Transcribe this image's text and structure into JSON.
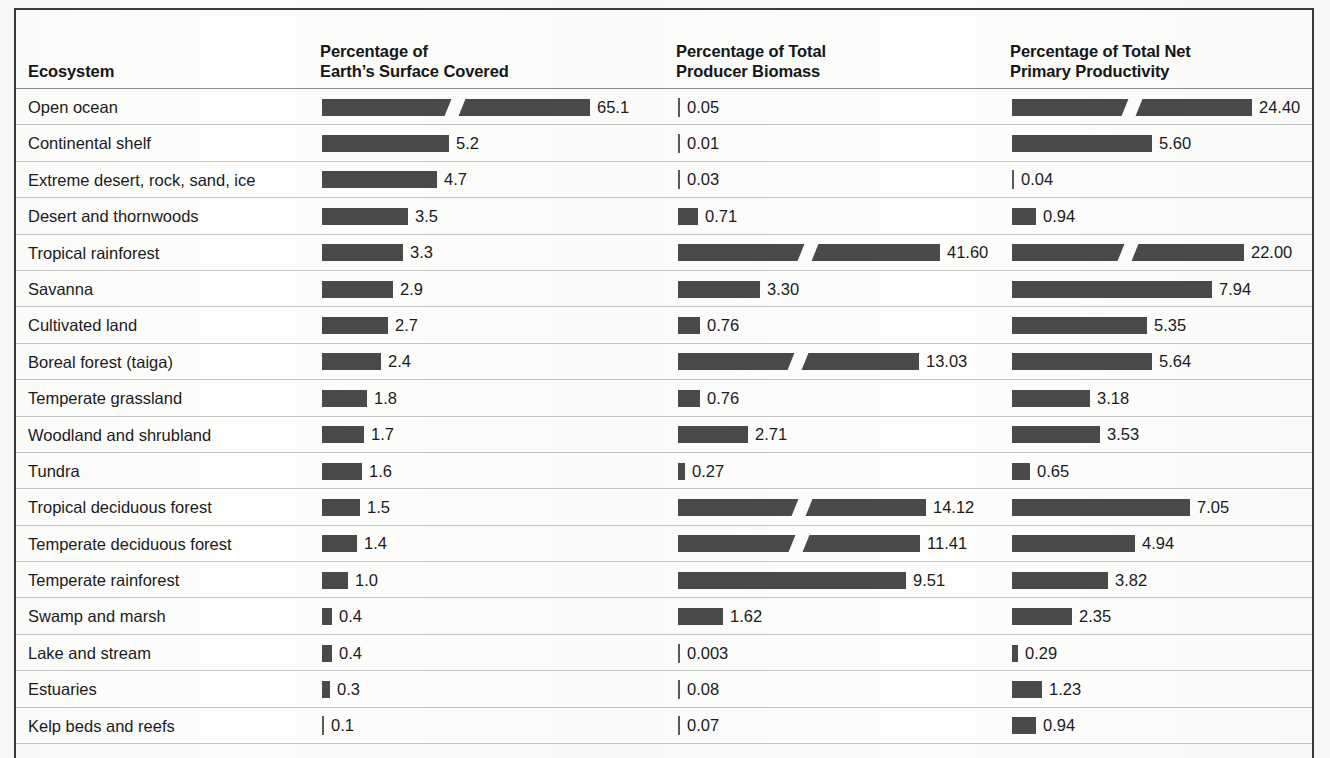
{
  "table": {
    "headers": {
      "ecosystem": {
        "line1": "Ecosystem",
        "line2": ""
      },
      "surface": {
        "line1": "Percentage of",
        "line2": "Earth’s Surface Covered"
      },
      "biomass": {
        "line1": "Percentage of Total",
        "line2": "Producer Biomass"
      },
      "npp": {
        "line1": "Percentage of Total Net",
        "line2": "Primary Productivity"
      }
    },
    "bar_color": "#4a4a4a",
    "rule_color": "#c6c6c6",
    "frame_color": "#3b3b3b",
    "rows": [
      {
        "ecosystem": "Open ocean",
        "surface": "65.1",
        "biomass": "0.05",
        "npp": "24.40"
      },
      {
        "ecosystem": "Continental shelf",
        "surface": "5.2",
        "biomass": "0.01",
        "npp": "5.60"
      },
      {
        "ecosystem": "Extreme desert, rock, sand, ice",
        "surface": "4.7",
        "biomass": "0.03",
        "npp": "0.04"
      },
      {
        "ecosystem": "Desert and thornwoods",
        "surface": "3.5",
        "biomass": "0.71",
        "npp": "0.94"
      },
      {
        "ecosystem": "Tropical rainforest",
        "surface": "3.3",
        "biomass": "41.60",
        "npp": "22.00"
      },
      {
        "ecosystem": "Savanna",
        "surface": "2.9",
        "biomass": "3.30",
        "npp": "7.94"
      },
      {
        "ecosystem": "Cultivated land",
        "surface": "2.7",
        "biomass": "0.76",
        "npp": "5.35"
      },
      {
        "ecosystem": "Boreal forest (taiga)",
        "surface": "2.4",
        "biomass": "13.03",
        "npp": "5.64"
      },
      {
        "ecosystem": "Temperate grassland",
        "surface": "1.8",
        "biomass": "0.76",
        "npp": "3.18"
      },
      {
        "ecosystem": "Woodland and shrubland",
        "surface": "1.7",
        "biomass": "2.71",
        "npp": "3.53"
      },
      {
        "ecosystem": "Tundra",
        "surface": "1.6",
        "biomass": "0.27",
        "npp": "0.65"
      },
      {
        "ecosystem": "Tropical deciduous forest",
        "surface": "1.5",
        "biomass": "14.12",
        "npp": "7.05"
      },
      {
        "ecosystem": "Temperate deciduous forest",
        "surface": "1.4",
        "biomass": "11.41",
        "npp": "4.94"
      },
      {
        "ecosystem": "Temperate rainforest",
        "surface": "1.0",
        "biomass": "9.51",
        "npp": "3.82"
      },
      {
        "ecosystem": "Swamp and marsh",
        "surface": "0.4",
        "biomass": "1.62",
        "npp": "2.35"
      },
      {
        "ecosystem": "Lake and stream",
        "surface": "0.4",
        "biomass": "0.003",
        "npp": "0.29"
      },
      {
        "ecosystem": "Estuaries",
        "surface": "0.3",
        "biomass": "0.08",
        "npp": "1.23"
      },
      {
        "ecosystem": "Kelp beds and reefs",
        "surface": "0.1",
        "biomass": "0.07",
        "npp": "0.94"
      }
    ]
  },
  "chart_data": {
    "type": "bar",
    "orientation": "horizontal",
    "grid": false,
    "legend": null,
    "note": "Bars with a white diagonal slash use a broken (compressed) scale.",
    "categories": [
      "Open ocean",
      "Continental shelf",
      "Extreme desert, rock, sand, ice",
      "Desert and thornwoods",
      "Tropical rainforest",
      "Savanna",
      "Cultivated land",
      "Boreal forest (taiga)",
      "Temperate grassland",
      "Woodland and shrubland",
      "Tundra",
      "Tropical deciduous forest",
      "Temperate deciduous forest",
      "Temperate rainforest",
      "Swamp and marsh",
      "Lake and stream",
      "Estuaries",
      "Kelp beds and reefs"
    ],
    "series": [
      {
        "name": "Percentage of Earth’s Surface Covered",
        "unit": "%",
        "values": [
          65.1,
          5.2,
          4.7,
          3.5,
          3.3,
          2.9,
          2.7,
          2.4,
          1.8,
          1.7,
          1.6,
          1.5,
          1.4,
          1.0,
          0.4,
          0.4,
          0.3,
          0.1
        ],
        "labels": [
          "65.1",
          "5.2",
          "4.7",
          "3.5",
          "3.3",
          "2.9",
          "2.7",
          "2.4",
          "1.8",
          "1.7",
          "1.6",
          "1.5",
          "1.4",
          "1.0",
          "0.4",
          "0.4",
          "0.3",
          "0.1"
        ],
        "broken_scale_rows": [
          "Open ocean"
        ],
        "pixel_widths": [
          268,
          127,
          115,
          86,
          81,
          71,
          66,
          59,
          45,
          42,
          40,
          38,
          35,
          26,
          10,
          10,
          8,
          2
        ]
      },
      {
        "name": "Percentage of Total Producer Biomass",
        "unit": "%",
        "values": [
          0.05,
          0.01,
          0.03,
          0.71,
          41.6,
          3.3,
          0.76,
          13.03,
          0.76,
          2.71,
          0.27,
          14.12,
          11.41,
          9.51,
          1.62,
          0.003,
          0.08,
          0.07
        ],
        "labels": [
          "0.05",
          "0.01",
          "0.03",
          "0.71",
          "41.60",
          "3.30",
          "0.76",
          "13.03",
          "0.76",
          "2.71",
          "0.27",
          "14.12",
          "11.41",
          "9.51",
          "1.62",
          "0.003",
          "0.08",
          "0.07"
        ],
        "broken_scale_rows": [
          "Tropical rainforest",
          "Boreal forest (taiga)",
          "Tropical deciduous forest",
          "Temperate deciduous forest"
        ],
        "pixel_widths": [
          2,
          2,
          2,
          20,
          262,
          82,
          22,
          241,
          22,
          70,
          7,
          248,
          242,
          228,
          45,
          2,
          2,
          2
        ]
      },
      {
        "name": "Percentage of Total Net Primary Productivity",
        "unit": "%",
        "values": [
          24.4,
          5.6,
          0.04,
          0.94,
          22.0,
          7.94,
          5.35,
          5.64,
          3.18,
          3.53,
          0.65,
          7.05,
          4.94,
          3.82,
          2.35,
          0.29,
          1.23,
          0.94
        ],
        "labels": [
          "24.40",
          "5.60",
          "0.04",
          "0.94",
          "22.00",
          "7.94",
          "5.35",
          "5.64",
          "3.18",
          "3.53",
          "0.65",
          "7.05",
          "4.94",
          "3.82",
          "2.35",
          "0.29",
          "1.23",
          "0.94"
        ],
        "broken_scale_rows": [
          "Open ocean",
          "Tropical rainforest"
        ],
        "pixel_widths": [
          240,
          140,
          2,
          24,
          232,
          200,
          135,
          140,
          78,
          88,
          18,
          178,
          123,
          96,
          60,
          6,
          30,
          24
        ]
      }
    ]
  }
}
